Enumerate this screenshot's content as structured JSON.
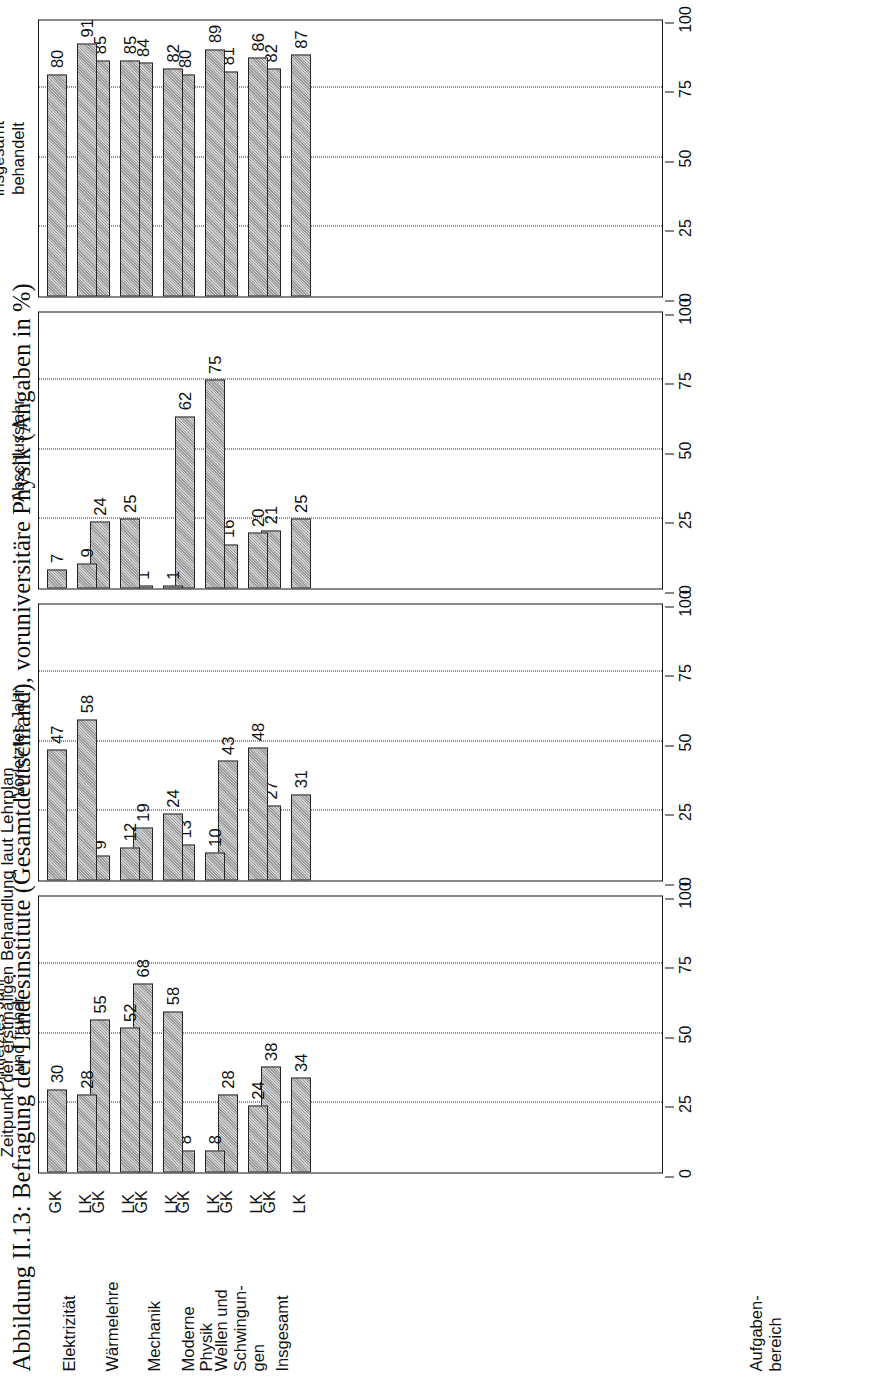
{
  "figure": {
    "caption": "Abbildung II.13: Befragung der Landesinstitute (Gesamtdeutschland), voruniversitäre Physik (Angaben in %)",
    "subtitle": "Zeitpunkt der erstmaligen Behandlung laut Lehrplan",
    "axis_group_label_line1": "Aufgaben-",
    "axis_group_label_line2": "bereich"
  },
  "chart_data": {
    "type": "bar",
    "title": "Abbildung II.13: Befragung der Landesinstitute (Gesamtdeutschland), voruniversitäre Physik (Angaben in %)",
    "subtitle": "Zeitpunkt der erstmaligen Behandlung laut Lehrplan",
    "xlabel": "",
    "ylabel": "Aufgabenbereich",
    "ylim": [
      0,
      100
    ],
    "ticks": [
      0,
      25,
      50,
      75,
      100
    ],
    "grid": true,
    "legend": "none",
    "orientation": "vertical-bars-in-rotated-page",
    "categories": [
      "Elektrizität",
      "Wärmelehre",
      "Mechanik",
      "Moderne Physik",
      "Wellen und Schwingungen",
      "Insgesamt"
    ],
    "category_label_lines": [
      [
        "Elektrizität"
      ],
      [
        "Wärmelehre"
      ],
      [
        "Mechanik"
      ],
      [
        "Moderne",
        "Physik"
      ],
      [
        "Wellen und",
        "Schwingun-",
        "gen"
      ],
      [
        "Insgesamt"
      ]
    ],
    "subgroups": [
      "GK",
      "LK"
    ],
    "panels": [
      {
        "title_lines": [
          "Drittletztes Jahr",
          "und früher"
        ],
        "title": "Drittletztes Jahr und früher",
        "series": [
          {
            "name": "GK",
            "values": [
              30,
              55,
              68,
              8,
              28,
              38
            ]
          },
          {
            "name": "LK",
            "values": [
              28,
              52,
              58,
              8,
              24,
              34
            ]
          }
        ]
      },
      {
        "title_lines": [
          "Vorletztes Jahr"
        ],
        "title": "Vorletztes Jahr",
        "series": [
          {
            "name": "GK",
            "values": [
              47,
              9,
              19,
              13,
              43,
              27
            ]
          },
          {
            "name": "LK",
            "values": [
              58,
              12,
              24,
              10,
              48,
              31
            ]
          }
        ]
      },
      {
        "title_lines": [
          "Abschlussjahr"
        ],
        "title": "Abschlussjahr",
        "series": [
          {
            "name": "GK",
            "values": [
              7,
              24,
              1,
              62,
              16,
              21
            ]
          },
          {
            "name": "LK",
            "values": [
              9,
              25,
              1,
              75,
              20,
              25
            ]
          }
        ]
      },
      {
        "title_lines": [
          "Laut Lehrplan",
          "insgesamt",
          "behandelt"
        ],
        "title": "Laut Lehrplan insgesamt behandelt",
        "series": [
          {
            "name": "GK",
            "values": [
              80,
              85,
              84,
              80,
              81,
              82
            ]
          },
          {
            "name": "LK",
            "values": [
              91,
              85,
              82,
              89,
              86,
              87
            ]
          }
        ]
      }
    ]
  }
}
